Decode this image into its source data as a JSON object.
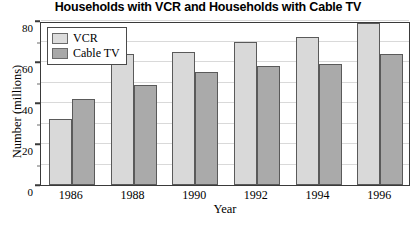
{
  "chart_data": {
    "type": "bar",
    "title": "Households with VCR and Households with Cable TV",
    "xlabel": "Year",
    "ylabel": "Number (millions)",
    "categories": [
      "1986",
      "1988",
      "1990",
      "1992",
      "1994",
      "1996"
    ],
    "series": [
      {
        "name": "VCR",
        "values": [
          32,
          64,
          65,
          70,
          72,
          79
        ],
        "color": "#d9d9d9"
      },
      {
        "name": "Cable TV",
        "values": [
          42,
          49,
          55,
          58,
          59,
          64
        ],
        "color": "#aaaaaa"
      }
    ],
    "ylim": [
      0,
      80
    ],
    "yticks": [
      0,
      20,
      40,
      60,
      80
    ],
    "ytick_labels": [
      "0",
      "20",
      "40",
      "60",
      "80"
    ],
    "grid": true,
    "legend_position": "top-left"
  },
  "legend": {
    "items": [
      {
        "label": "VCR"
      },
      {
        "label": "Cable TV"
      }
    ]
  }
}
